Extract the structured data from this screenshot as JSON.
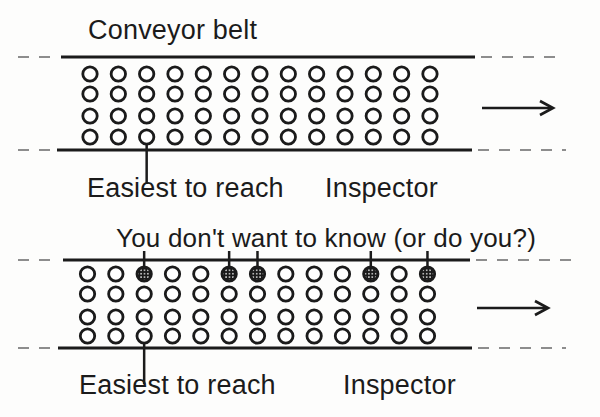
{
  "palette": {
    "background": "#fdfdfc",
    "ink": "#1b1b1b",
    "dash": "#8d8d8d",
    "defect_fill": "#191919",
    "defect_speckle": "#e9e9e9",
    "item_fill": "#ffffff"
  },
  "top_belt": {
    "title": "Conveyor belt",
    "easiest_label": "Easiest to reach",
    "inspector_label": "Inspector",
    "rows": 4,
    "columns": 13,
    "marked_columns": [],
    "marked_row": null,
    "easiest_pointer_column": 3,
    "direction_arrow": "right"
  },
  "bottom_belt": {
    "title": "You don't want to know (or do you?)",
    "easiest_label": "Easiest to reach",
    "inspector_label": "Inspector",
    "rows": 4,
    "columns": 13,
    "marked_columns": [
      3,
      6,
      7,
      11,
      13
    ],
    "marked_row": 1,
    "easiest_pointer_column": 3,
    "direction_arrow": "right"
  }
}
